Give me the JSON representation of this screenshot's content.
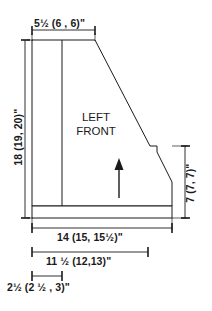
{
  "drawing": {
    "part_label_line1": "LEFT",
    "part_label_line2": "FRONT",
    "grain_arrow": "up-arrow-icon",
    "stroke_color": "#1a1a1a",
    "fill_color": "#ffffff",
    "background_color": "#ffffff"
  },
  "dimensions": {
    "top_width": "5½ (6 , 6)\"",
    "left_height": "18 (19, 20)\"",
    "right_height": "7 (7, 7)\"",
    "bottom_overall": "14 (15, 15½)\"",
    "bottom_middle": "11 ½ (12,13)\"",
    "bottom_small": "2½ (2 ½ , 3)\""
  }
}
